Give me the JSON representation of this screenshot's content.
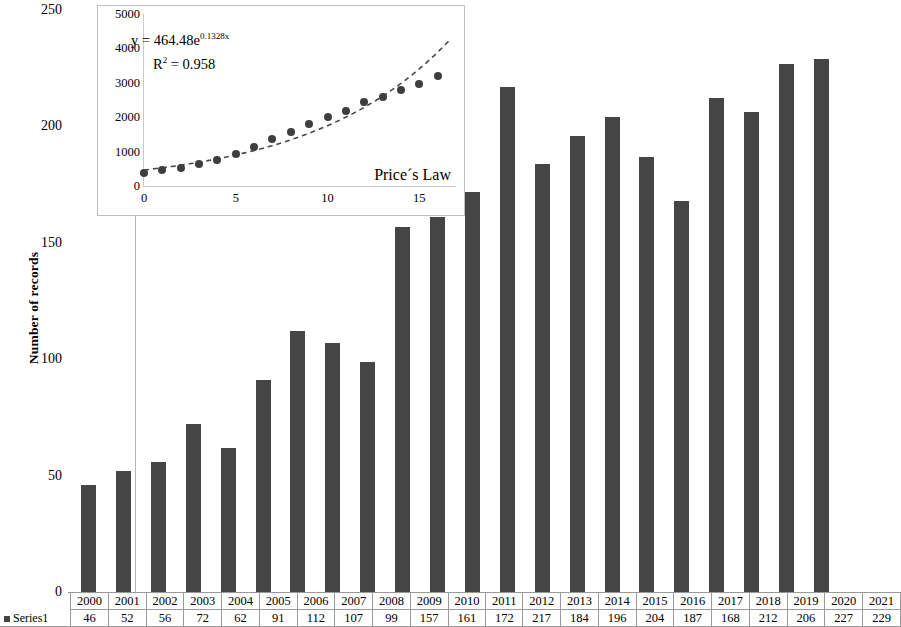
{
  "chart_data": {
    "type": "bar",
    "title": "",
    "xlabel": "",
    "ylabel": "Number of records",
    "ylim": [
      0,
      250
    ],
    "ytick_labels": [
      "250",
      "200",
      "150",
      "100",
      "50",
      "0"
    ],
    "yticks": [
      250,
      200,
      150,
      100,
      50,
      0
    ],
    "grid": false,
    "legend": "Series1",
    "bar_color": "#454545",
    "categories": [
      "2000",
      "2001",
      "2002",
      "2003",
      "2004",
      "2005",
      "2006",
      "2007",
      "2008",
      "2009",
      "2010",
      "2011",
      "2012",
      "2013",
      "2014",
      "2015",
      "2016",
      "2017",
      "2018",
      "2019",
      "2020",
      "2021"
    ],
    "values": [
      46,
      52,
      56,
      72,
      62,
      91,
      112,
      107,
      99,
      157,
      161,
      172,
      217,
      184,
      196,
      204,
      187,
      168,
      212,
      206,
      227,
      229
    ],
    "series": [
      {
        "name": "Series1",
        "values": [
          46,
          52,
          56,
          72,
          62,
          91,
          112,
          107,
          99,
          157,
          161,
          172,
          217,
          184,
          196,
          204,
          187,
          168,
          212,
          206,
          227,
          229
        ]
      }
    ],
    "inset": {
      "type": "scatter",
      "label": "Price´s Law",
      "equation": "y = 464.48e",
      "equation_exponent": "0.1328x",
      "r_squared_label": "R",
      "r_squared_sup": "2",
      "r_squared_value": "= 0.958",
      "xlim": [
        0,
        17
      ],
      "ylim": [
        0,
        5000
      ],
      "xtick_labels": [
        "0",
        "5",
        "10",
        "15"
      ],
      "xticks": [
        0,
        5,
        10,
        15
      ],
      "ytick_labels": [
        "5000",
        "4000",
        "3000",
        "2000",
        "1000",
        "0"
      ],
      "yticks": [
        5000,
        4000,
        3000,
        2000,
        1000,
        0
      ],
      "x": [
        0,
        1,
        2,
        3,
        4,
        5,
        6,
        7,
        8,
        9,
        10,
        11,
        12,
        13,
        14,
        15,
        16
      ],
      "y": [
        370,
        460,
        520,
        630,
        760,
        930,
        1120,
        1370,
        1580,
        1800,
        2000,
        2180,
        2430,
        2600,
        2800,
        2960,
        3200
      ],
      "fit_curve": {
        "a": 464.48,
        "b": 0.1328,
        "style": "dashed",
        "color": "#4a4a4a"
      },
      "point_color": "#3e3e3e"
    }
  },
  "table": {
    "row_label": "Series1",
    "headers": [
      "2000",
      "2001",
      "2002",
      "2003",
      "2004",
      "2005",
      "2006",
      "2007",
      "2008",
      "2009",
      "2010",
      "2011",
      "2012",
      "2013",
      "2014",
      "2015",
      "2016",
      "2017",
      "2018",
      "2019",
      "2020",
      "2021"
    ],
    "values": [
      "46",
      "52",
      "56",
      "72",
      "62",
      "91",
      "112",
      "107",
      "99",
      "157",
      "161",
      "172",
      "217",
      "184",
      "196",
      "204",
      "187",
      "168",
      "212",
      "206",
      "227",
      "229"
    ]
  }
}
